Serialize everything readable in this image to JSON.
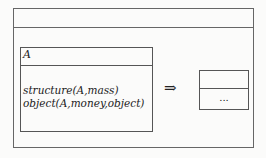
{
  "diagram": {
    "source_class": {
      "name": "A",
      "attributes": [
        "structure(A,mass)",
        "object(A,money,object)"
      ]
    },
    "arrow": "⇒",
    "target_class": {
      "name": "",
      "body": "..."
    }
  }
}
